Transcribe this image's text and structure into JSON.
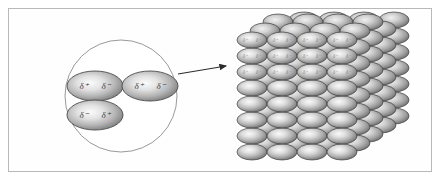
{
  "figure": {
    "background_color": "#ffffff",
    "frame_color": "#b9b9b9"
  },
  "magnifier": {
    "name": "magnified detail circle",
    "center_x": 121,
    "center_y": 96,
    "radius": 56,
    "stroke_color": "#8d8d8d"
  },
  "molecules": [
    {
      "id": "molecule-top-left",
      "cx": 95,
      "cy": 86,
      "rx": 28,
      "ry": 15,
      "left_charge": "δ⁺",
      "right_charge": "δ⁻"
    },
    {
      "id": "molecule-top-right",
      "cx": 150,
      "cy": 86,
      "rx": 28,
      "ry": 15,
      "left_charge": "δ⁺",
      "right_charge": "δ⁻"
    },
    {
      "id": "molecule-bottom-left",
      "cx": 95,
      "cy": 115,
      "rx": 28,
      "ry": 15,
      "left_charge": "δ⁻",
      "right_charge": "δ⁺"
    }
  ],
  "pointer": {
    "name": "leader arrow from magnifier to lattice",
    "from_x": 178,
    "from_y": 74,
    "to_x": 226,
    "to_y": 66,
    "color": "#2b2b2b"
  },
  "lattice": {
    "name": "three dimensional molecular crystal lattice",
    "columns": 4,
    "rows": 8,
    "depth_layers": 5,
    "origin_x": 252,
    "origin_y": 152,
    "col_spacing": 30,
    "row_spacing": 16,
    "depth_dx": 13,
    "depth_dy": -9,
    "ellipse_rx": 15,
    "ellipse_ry": 8,
    "labeled_rows": 3,
    "left_charge": "δ⁺",
    "right_charge": "δ⁻"
  },
  "colors": {
    "ellipse_highlight": "#f6f6f6",
    "ellipse_midtone": "#c2c2c2",
    "ellipse_shadow": "#6f6f6f",
    "ellipse_outline": "#4a4a4a",
    "lattice_outline": "#3f3f3f",
    "label_text": "#3a3a3a"
  }
}
